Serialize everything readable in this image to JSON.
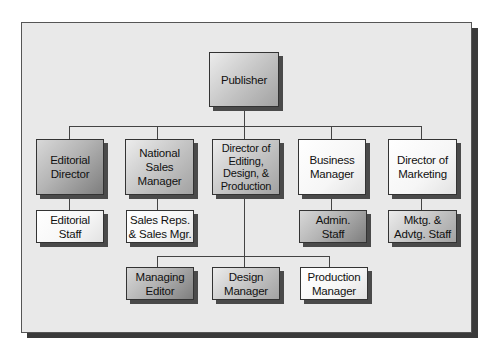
{
  "diagram": {
    "type": "org-chart",
    "root": {
      "id": "publisher",
      "label": "Publisher",
      "shade": "medium"
    },
    "level2": [
      {
        "id": "editorial-director",
        "label": "Editorial\nDirector",
        "shade": "dark"
      },
      {
        "id": "national-sales-manager",
        "label": "National Sales\nManager",
        "shade": "medium"
      },
      {
        "id": "director-editing-design-production",
        "label": "Director of\nEditing,\nDesign, &\nProduction",
        "shade": "medium"
      },
      {
        "id": "business-manager",
        "label": "Business\nManager",
        "shade": "light"
      },
      {
        "id": "director-of-marketing",
        "label": "Director of\nMarketing",
        "shade": "light"
      }
    ],
    "level3": [
      {
        "id": "editorial-staff",
        "label": "Editorial\nStaff",
        "parent": "editorial-director",
        "shade": "light"
      },
      {
        "id": "sales-reps",
        "label": "Sales Reps.\n& Sales Mgr.",
        "parent": "national-sales-manager",
        "shade": "light"
      },
      {
        "id": "admin-staff",
        "label": "Admin.\nStaff",
        "parent": "business-manager",
        "shade": "dark"
      },
      {
        "id": "mktg-advtg-staff",
        "label": "Mktg. &\nAdvtg. Staff",
        "parent": "director-of-marketing",
        "shade": "medium"
      }
    ],
    "level4": [
      {
        "id": "managing-editor",
        "label": "Managing\nEditor",
        "parent": "director-editing-design-production",
        "shade": "dark"
      },
      {
        "id": "design-manager",
        "label": "Design\nManager",
        "parent": "director-editing-design-production",
        "shade": "medium"
      },
      {
        "id": "production-manager",
        "label": "Production\nManager",
        "parent": "director-editing-design-production",
        "shade": "light"
      }
    ]
  }
}
